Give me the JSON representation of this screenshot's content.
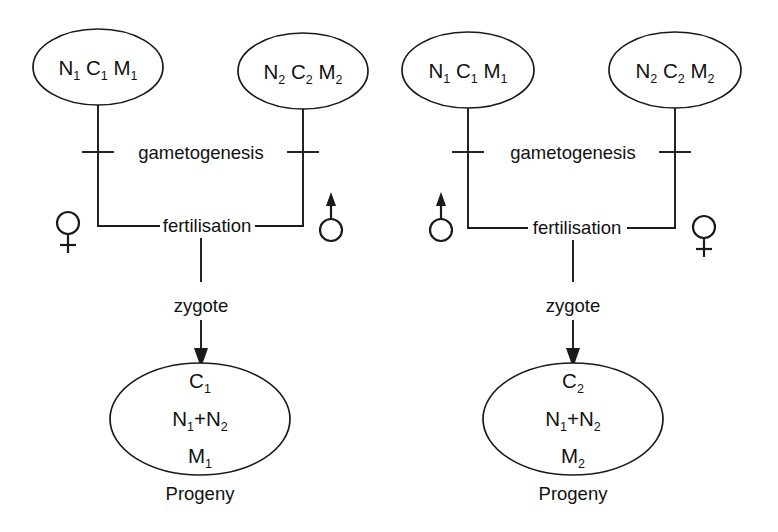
{
  "figure": {
    "type": "reciprocal-cross-inheritance-diagram",
    "background_color": "#ffffff",
    "line_color": "#1a1a1a",
    "text_color": "#111111"
  },
  "panels": [
    {
      "id": "left-cross",
      "parents": [
        {
          "id": "left-panel-parent-1",
          "sex": "female",
          "sex_symbol": "venus",
          "genome": [
            {
              "letter": "N",
              "subscript": "1"
            },
            {
              "letter": "C",
              "subscript": "1"
            },
            {
              "letter": "M",
              "subscript": "1"
            }
          ]
        },
        {
          "id": "left-panel-parent-2",
          "sex": "male",
          "sex_symbol": "mars",
          "genome": [
            {
              "letter": "N",
              "subscript": "2"
            },
            {
              "letter": "C",
              "subscript": "2"
            },
            {
              "letter": "M",
              "subscript": "2"
            }
          ]
        }
      ],
      "stages": {
        "gametogenesis": "gametogenesis",
        "fertilisation": "fertilisation",
        "zygote": "zygote"
      },
      "progeny": {
        "caption": "Progeny",
        "rows": [
          {
            "text": "C",
            "subscript": "2"
          },
          {
            "text": "N+N",
            "subscript": ""
          },
          {
            "text": "M",
            "subscript": "1"
          }
        ],
        "cytoplasmic": {
          "letter": "C",
          "subscript": "1"
        },
        "nuclear": {
          "left_letter": "N",
          "left_sub": "1",
          "operator": "+",
          "right_letter": "N",
          "right_sub": "2"
        },
        "mitochondrial": {
          "letter": "M",
          "subscript": "1"
        }
      }
    },
    {
      "id": "right-cross",
      "parents": [
        {
          "id": "right-panel-parent-1",
          "sex": "male",
          "sex_symbol": "mars",
          "genome": [
            {
              "letter": "N",
              "subscript": "1"
            },
            {
              "letter": "C",
              "subscript": "1"
            },
            {
              "letter": "M",
              "subscript": "1"
            }
          ]
        },
        {
          "id": "right-panel-parent-2",
          "sex": "female",
          "sex_symbol": "venus",
          "genome": [
            {
              "letter": "N",
              "subscript": "2"
            },
            {
              "letter": "C",
              "subscript": "2"
            },
            {
              "letter": "M",
              "subscript": "2"
            }
          ]
        }
      ],
      "stages": {
        "gametogenesis": "gametogenesis",
        "fertilisation": "fertilisation",
        "zygote": "zygote"
      },
      "progeny": {
        "caption": "Progeny",
        "cytoplasmic": {
          "letter": "C",
          "subscript": "2"
        },
        "nuclear": {
          "left_letter": "N",
          "left_sub": "1",
          "operator": "+",
          "right_letter": "N",
          "right_sub": "2"
        },
        "mitochondrial": {
          "letter": "M",
          "subscript": "2"
        }
      }
    }
  ]
}
